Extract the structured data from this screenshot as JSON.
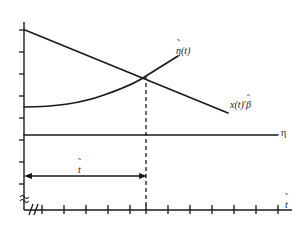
{
  "figure": {
    "type": "line-plot-diagram",
    "background_color": "#ffffff",
    "line_color": "#1a1a1a"
  },
  "axes": {
    "x_axis": {
      "label": "t̃",
      "label_parts": {
        "base": "t",
        "accent": "˜"
      },
      "has_break_symbol": true,
      "break_symbol": "≈",
      "tick_count": 12,
      "tick_positions_px": [
        42,
        64,
        86,
        108,
        130,
        146,
        168,
        190,
        212,
        234,
        256,
        278
      ],
      "origin_px": 24,
      "end_px": 292,
      "y_px": 210
    },
    "y_axis": {
      "label": "",
      "has_break_symbol": true,
      "break_symbol": "≈",
      "tick_count": 8,
      "tick_positions_px": [
        30,
        52,
        74,
        96,
        118,
        140,
        162,
        184
      ],
      "x_px": 24,
      "top_px": 22,
      "bottom_px": 210
    }
  },
  "series": [
    {
      "name": "eta-tilde-curve",
      "label": "η̃(t)",
      "label_parts": {
        "accent": "˜",
        "base": "η",
        "suffix": "(t)"
      },
      "style": "solid",
      "shape": "increasing-convex",
      "start_point_px": {
        "x": 24,
        "y": 107
      },
      "end_point_px": {
        "x": 178,
        "y": 56
      },
      "control_points_px": [
        {
          "x": 24,
          "y": 107
        },
        {
          "x": 72,
          "y": 106
        },
        {
          "x": 104,
          "y": 96
        },
        {
          "x": 146,
          "y": 76
        },
        {
          "x": 178,
          "y": 56
        }
      ]
    },
    {
      "name": "x-beta-line",
      "label": "x(t)′β̂",
      "label_parts": {
        "base": "x(t)",
        "prime": "′",
        "accent": "̂",
        "symbol": "β"
      },
      "style": "solid",
      "shape": "decreasing-straight",
      "start_point_px": {
        "x": 25,
        "y": 30
      },
      "end_point_px": {
        "x": 228,
        "y": 113
      }
    },
    {
      "name": "eta-constant-line",
      "label": "η",
      "style": "solid",
      "shape": "horizontal-constant",
      "start_point_px": {
        "x": 24,
        "y": 135
      },
      "end_point_px": {
        "x": 278,
        "y": 135
      }
    }
  ],
  "annotations": {
    "intersection": {
      "name": "intersection-point",
      "x_px": 146,
      "y_px": 76
    },
    "dashed_dropline": {
      "name": "dashed-dropline",
      "style": "dashed",
      "x_px": 146,
      "from_y_px": 76,
      "to_y_px": 210
    },
    "measure_arrow": {
      "name": "t-tilde-measure-arrow",
      "label": "t̃",
      "label_parts": {
        "base": "t",
        "accent": "˜"
      },
      "from_x_px": 25,
      "to_x_px": 146,
      "y_px": 176,
      "double_headed": true
    }
  }
}
